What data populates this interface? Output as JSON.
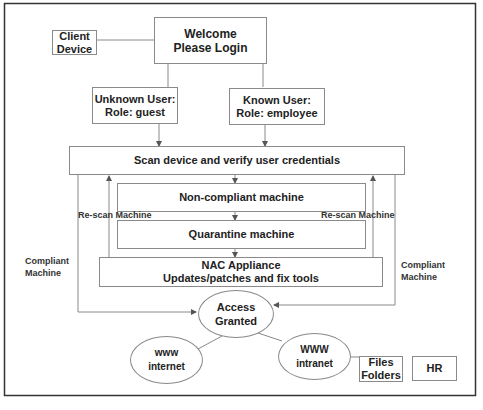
{
  "diagram": {
    "nodes": {
      "client_device": {
        "line1": "Client",
        "line2": "Device"
      },
      "welcome": {
        "line1": "Welcome",
        "line2": "Please Login"
      },
      "unknown_user": {
        "line1": "Unknown User:",
        "line2": "Role: guest"
      },
      "known_user": {
        "line1": "Known User:",
        "line2": "Role: employee"
      },
      "scan": {
        "text": "Scan device and verify user credentials"
      },
      "non_compliant": {
        "text": "Non-compliant machine"
      },
      "quarantine": {
        "text": "Quarantine machine"
      },
      "nac": {
        "line1": "NAC Appliance",
        "line2": "Updates/patches and fix tools"
      },
      "access": {
        "line1": "Access",
        "line2": "Granted"
      },
      "www_internet": {
        "line1": "www",
        "line2": "internet"
      },
      "www_intranet": {
        "line1": "WWW",
        "line2": "intranet"
      },
      "files": {
        "line1": "Files",
        "line2": "Folders"
      },
      "hr": {
        "text": "HR"
      }
    },
    "edge_labels": {
      "rescan_left": "Re-scan Machine",
      "rescan_right": "Re-scan Machine",
      "compliant_left_1": "Compliant",
      "compliant_left_2": "Machine",
      "compliant_right_1": "Compliant",
      "compliant_right_2": "Machine"
    },
    "colors": {
      "line": "#8a8a8a",
      "border": "#333333",
      "text": "#222222"
    }
  }
}
